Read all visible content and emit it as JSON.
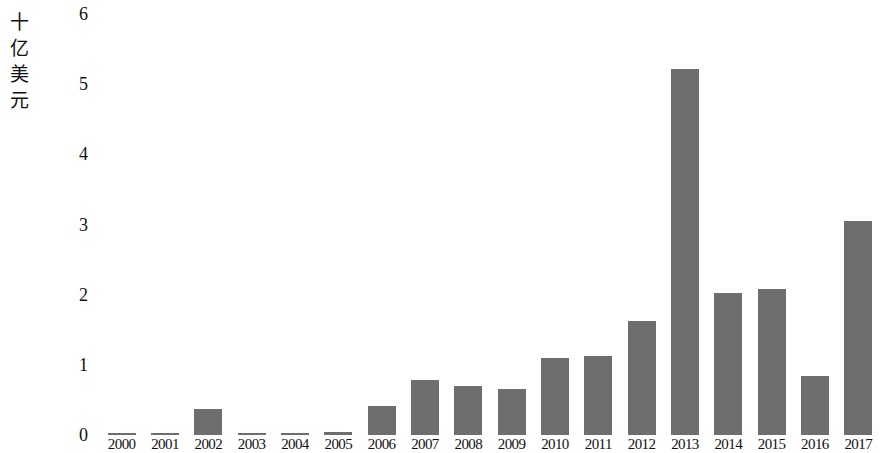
{
  "chart_data": {
    "type": "bar",
    "title": "",
    "subtitle": "",
    "xlabel": "",
    "ylabel": "十亿美元",
    "ylabel_chars": [
      "十",
      "亿",
      "美",
      "元"
    ],
    "ylim": [
      0,
      6
    ],
    "yticks": [
      6,
      5,
      4,
      3,
      2,
      1,
      0
    ],
    "ytick_labels": [
      "6",
      "5",
      "4",
      "3",
      "2",
      "1",
      "0"
    ],
    "grid": false,
    "legend": null,
    "bar_color": "#6e6e6e",
    "categories": [
      "2000",
      "2001",
      "2002",
      "2003",
      "2004",
      "2005",
      "2006",
      "2007",
      "2008",
      "2009",
      "2010",
      "2011",
      "2012",
      "2013",
      "2014",
      "2015",
      "2016",
      "2017"
    ],
    "values": [
      0.03,
      0.03,
      0.37,
      0.03,
      0.03,
      0.05,
      0.42,
      0.78,
      0.7,
      0.66,
      1.1,
      1.12,
      1.62,
      5.22,
      2.03,
      2.08,
      0.84,
      3.05
    ],
    "series": [
      {
        "name": "",
        "values": [
          0.03,
          0.03,
          0.37,
          0.03,
          0.03,
          0.05,
          0.42,
          0.78,
          0.7,
          0.66,
          1.1,
          1.12,
          1.62,
          5.22,
          2.03,
          2.08,
          0.84,
          3.05
        ]
      }
    ]
  }
}
